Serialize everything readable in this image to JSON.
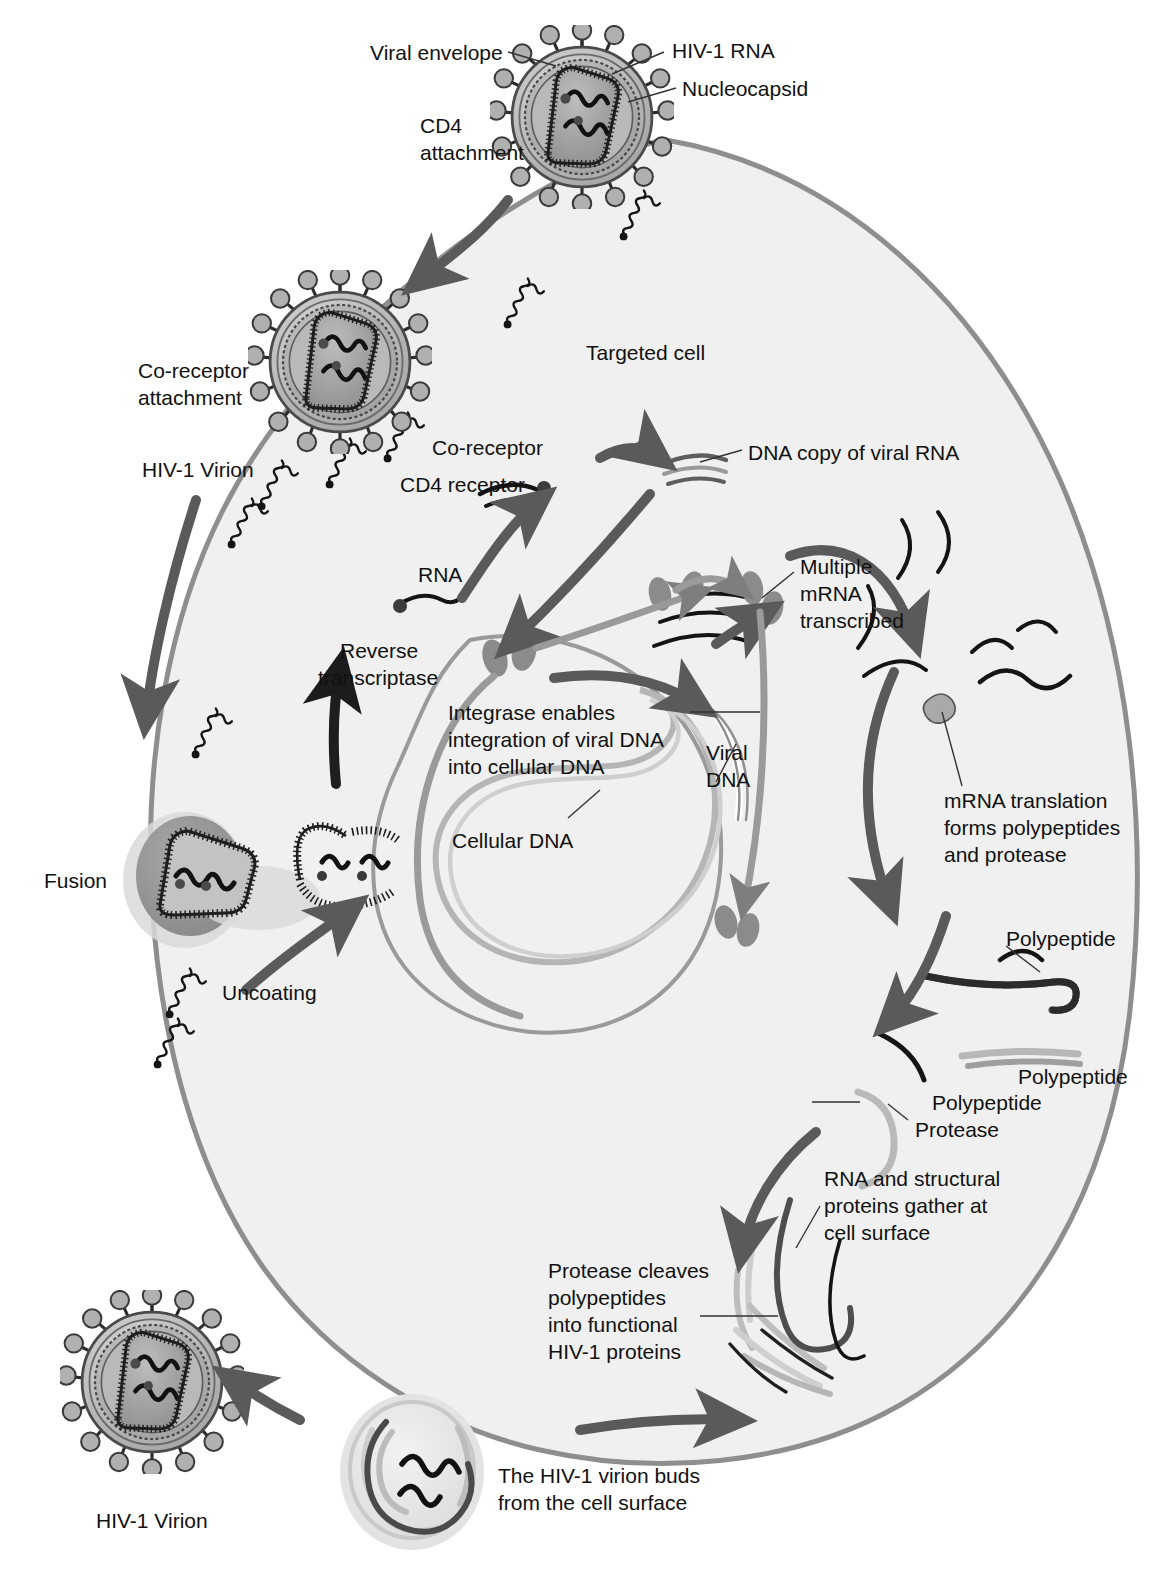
{
  "diagram": {
    "colors": {
      "background": "#ffffff",
      "cell_fill": "#f0f0f0",
      "cell_membrane": "#8e8e8e",
      "nucleus_outline": "#9a9a9a",
      "arrow_dark": "#5a5a5a",
      "arrow_black": "#1a1a1a",
      "dna_light": "#b5b5b5",
      "rna_black": "#141414",
      "protein_mid": "#8b8b8b",
      "text": "#111111"
    }
  },
  "labels": {
    "viral_envelope": "Viral envelope",
    "hiv1_rna": "HIV-1 RNA",
    "nucleocapsid": "Nucleocapsid",
    "cd4_attachment_l1": "CD4",
    "cd4_attachment_l2": "attachment",
    "coreceptor_attachment_l1": "Co-receptor",
    "coreceptor_attachment_l2": "attachment",
    "hiv1_virion_top": "HIV-1 Virion",
    "targeted_cell": "Targeted cell",
    "coreceptor": "Co-receptor",
    "cd4_receptor": "CD4 receptor",
    "dna_copy_of_viral_rna": "DNA copy of viral RNA",
    "rna": "RNA",
    "reverse_transcriptase_l1": "Reverse",
    "reverse_transcriptase_l2": "transcriptase",
    "multiple_mrna_l1": "Multiple",
    "multiple_mrna_l2": "mRNA",
    "multiple_mrna_l3": "transcribed",
    "integrase_l1": "Integrase enables",
    "integrase_l2": "integration of viral DNA",
    "integrase_l3": "into cellular DNA",
    "viral_dna_l1": "Viral",
    "viral_dna_l2": "DNA",
    "cellular_dna": "Cellular DNA",
    "mrna_translation_l1": "mRNA translation",
    "mrna_translation_l2": "forms polypeptides",
    "mrna_translation_l3": "and protease",
    "polypeptide_1": "Polypeptide",
    "polypeptide_2": "Polypeptide",
    "polypeptide_3": "Polypeptide",
    "protease": "Protease",
    "fusion": "Fusion",
    "uncoating": "Uncoating",
    "rna_structural_l1": "RNA and structural",
    "rna_structural_l2": "proteins gather at",
    "rna_structural_l3": "cell surface",
    "protease_cleaves_l1": "Protease cleaves",
    "protease_cleaves_l2": "polypeptides",
    "protease_cleaves_l3": "into functional",
    "protease_cleaves_l4": "HIV-1 proteins",
    "virion_buds_l1": "The HIV-1 virion buds",
    "virion_buds_l2": "from the cell surface",
    "hiv1_virion_bottom": "HIV-1 Virion"
  },
  "icons": {
    "virion": "hiv-virion-icon",
    "receptor": "membrane-receptor-icon",
    "nucleus": "cell-nucleus-icon",
    "arrow": "process-arrow-icon",
    "rna_strand": "rna-strand-icon",
    "dna_strand": "dna-strand-icon",
    "polypeptide_strand": "polypeptide-strand-icon",
    "protease_enzyme": "protease-enzyme-icon",
    "budding_virion": "budding-virion-icon"
  }
}
